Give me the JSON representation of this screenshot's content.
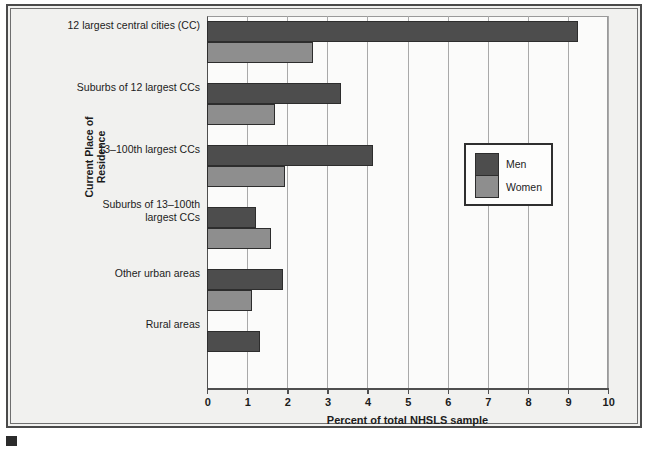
{
  "chart_data": {
    "type": "bar",
    "orientation": "horizontal",
    "title": "",
    "xlabel": "Percent of total NHSLS sample",
    "ylabel": "Current Place of Residence",
    "xlim": [
      0,
      10
    ],
    "xticks": [
      "0",
      "1",
      "2",
      "3",
      "4",
      "5",
      "6",
      "7",
      "8",
      "9",
      "10"
    ],
    "grid": "vertical",
    "legend_position": "right-middle",
    "categories": [
      "12 largest central cities (CC)",
      "Suburbs of 12 largest CCs",
      "13–100th largest CCs",
      "Suburbs of 13–100th largest CCs",
      "Other urban areas",
      "Rural areas"
    ],
    "category_lines": [
      [
        "12 largest central cities (CC)"
      ],
      [
        "Suburbs of 12 largest CCs"
      ],
      [
        "13–100th largest CCs"
      ],
      [
        "Suburbs of 13–100th",
        "largest CCs"
      ],
      [
        "Other urban areas"
      ],
      [
        "Rural areas"
      ]
    ],
    "series": [
      {
        "name": "Men",
        "color": "#4d4d4d",
        "values": [
          9.25,
          3.35,
          4.15,
          1.22,
          1.9,
          1.32
        ]
      },
      {
        "name": "Women",
        "color": "#8e8e8e",
        "values": [
          2.64,
          1.7,
          1.95,
          1.6,
          1.12,
          0
        ]
      }
    ]
  },
  "legend": {
    "entries": [
      {
        "label": "Men"
      },
      {
        "label": "Women"
      }
    ]
  },
  "colors": {
    "men": "#4d4d4d",
    "women": "#8e8e8e",
    "frame": "#4a4a4a",
    "grid": "#a9a9a9",
    "background": "#f1f1ef"
  }
}
